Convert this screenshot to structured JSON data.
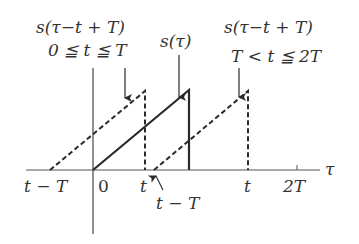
{
  "diagram": {
    "labels": {
      "left_top_line1": "s(τ−t + T)",
      "left_top_line2": "0 ≦ t ≦ T",
      "middle_top": "s(τ)",
      "right_top_line1": "s(τ−t + T)",
      "right_top_line2": "T < t ≦ 2T",
      "axis_tau": "τ",
      "tick_t_minus_T_left": "t − T",
      "tick_zero": "0",
      "tick_t_left": "t",
      "tick_t_minus_T_right": "t − T",
      "tick_t_right": "t",
      "tick_2T": "2T"
    },
    "colors": {
      "stroke": "#2a2a2a",
      "text": "#333333",
      "background": "#ffffff"
    }
  }
}
